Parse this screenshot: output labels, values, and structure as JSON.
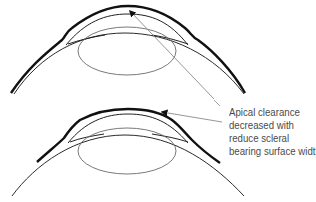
{
  "figure": {
    "panels": [
      {
        "id": "top",
        "name": "wider scleral bearing surface"
      },
      {
        "id": "bottom",
        "name": "reduced scleral bearing surface width"
      }
    ],
    "annotation": {
      "lines": [
        "Apical clearance",
        "decreased with",
        "reduce scleral",
        "bearing surface width"
      ]
    },
    "colors": {
      "lens": "#111111",
      "cornea": "#2a2a2a",
      "crystalline_lens": "#6a6a6a",
      "leader_line": "#8a8a8a",
      "text": "#4a4a4a"
    }
  }
}
